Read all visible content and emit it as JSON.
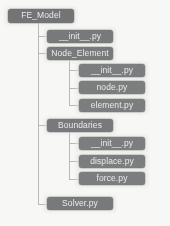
{
  "diagram": {
    "type": "tree",
    "background_color": "#f7f7f6",
    "node_fill_color": "#77787a",
    "node_text_color": "#e9eaea",
    "connector_color": "#b9b9b7",
    "nodes": [
      {
        "id": "fe_model",
        "label": "FE_Model",
        "level": 0,
        "x": 8,
        "y": 9,
        "w": 66,
        "h": 14
      },
      {
        "id": "init_root",
        "label": "__init__.py",
        "level": 1,
        "x": 47,
        "y": 30,
        "w": 66,
        "h": 13
      },
      {
        "id": "node_element",
        "label": "Node_Element",
        "level": 1,
        "x": 47,
        "y": 47,
        "w": 66,
        "h": 13
      },
      {
        "id": "init_ne",
        "label": "__init__.py",
        "level": 2,
        "x": 79,
        "y": 64,
        "w": 66,
        "h": 13
      },
      {
        "id": "node_py",
        "label": "node.py",
        "level": 2,
        "x": 79,
        "y": 81,
        "w": 66,
        "h": 13
      },
      {
        "id": "element_py",
        "label": "element.py",
        "level": 2,
        "x": 79,
        "y": 99,
        "w": 66,
        "h": 13
      },
      {
        "id": "boundaries",
        "label": "Boundaries",
        "level": 1,
        "x": 47,
        "y": 119,
        "w": 66,
        "h": 13
      },
      {
        "id": "init_bd",
        "label": "__init__.py",
        "level": 2,
        "x": 79,
        "y": 137,
        "w": 66,
        "h": 13
      },
      {
        "id": "displace_py",
        "label": "displace.py",
        "level": 2,
        "x": 79,
        "y": 155,
        "w": 66,
        "h": 13
      },
      {
        "id": "force_py",
        "label": "force.py",
        "level": 2,
        "x": 79,
        "y": 172,
        "w": 66,
        "h": 13
      },
      {
        "id": "solver_py",
        "label": "Solver.py",
        "level": 1,
        "x": 47,
        "y": 197,
        "w": 66,
        "h": 13
      }
    ],
    "connectors": [
      {
        "id": "trunk-root",
        "orient": "v",
        "x": 38,
        "y": 23,
        "len": 181
      },
      {
        "id": "stub-init-root",
        "orient": "h",
        "x": 38,
        "y": 36,
        "len": 10
      },
      {
        "id": "stub-node-element",
        "orient": "h",
        "x": 38,
        "y": 53,
        "len": 10
      },
      {
        "id": "stub-boundaries",
        "orient": "h",
        "x": 38,
        "y": 125,
        "len": 10
      },
      {
        "id": "stub-solver",
        "orient": "h",
        "x": 38,
        "y": 204,
        "len": 10
      },
      {
        "id": "trunk-node-element",
        "orient": "v",
        "x": 69,
        "y": 60,
        "len": 46
      },
      {
        "id": "stub-init-ne",
        "orient": "h",
        "x": 69,
        "y": 70,
        "len": 11
      },
      {
        "id": "stub-node-py",
        "orient": "h",
        "x": 69,
        "y": 88,
        "len": 11
      },
      {
        "id": "stub-element-py",
        "orient": "h",
        "x": 69,
        "y": 105,
        "len": 11
      },
      {
        "id": "trunk-boundaries",
        "orient": "v",
        "x": 69,
        "y": 132,
        "len": 47
      },
      {
        "id": "stub-init-bd",
        "orient": "h",
        "x": 69,
        "y": 143,
        "len": 11
      },
      {
        "id": "stub-displace-py",
        "orient": "h",
        "x": 69,
        "y": 161,
        "len": 11
      },
      {
        "id": "stub-force-py",
        "orient": "h",
        "x": 69,
        "y": 179,
        "len": 11
      }
    ]
  }
}
